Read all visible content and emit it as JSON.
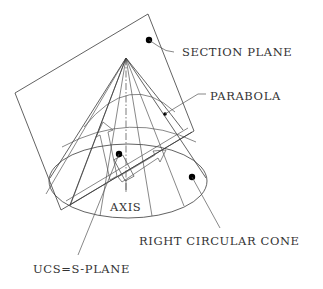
{
  "diagram": {
    "labels": {
      "section_plane": "SECTION PLANE",
      "parabola": "PARABOLA",
      "axis": "AXIS",
      "cone": "RIGHT CIRCULAR CONE",
      "ucs": "UCS=S-PLANE"
    },
    "colors": {
      "background": "#ffffff",
      "line": "#3a3a3a",
      "text": "#333333",
      "marker": "#000000"
    }
  }
}
